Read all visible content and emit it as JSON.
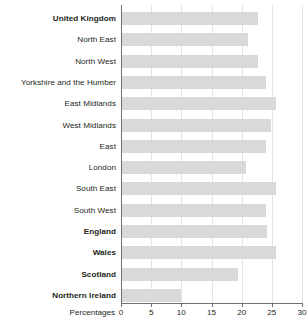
{
  "chart_data": {
    "type": "bar",
    "orientation": "horizontal",
    "title": "",
    "xlabel": "Percentages",
    "ylabel": "",
    "xlim": [
      0,
      30
    ],
    "xticks": [
      0,
      5,
      10,
      15,
      20,
      25,
      30
    ],
    "grid": true,
    "legend": false,
    "bar_color": "#d9d9d9",
    "categories": [
      "United Kingdom",
      "North East",
      "North West",
      "Yorkshire and the Humber",
      "East Midlands",
      "West Midlands",
      "East",
      "London",
      "South East",
      "South West",
      "England",
      "Wales",
      "Scotland",
      "Northern Ireland"
    ],
    "emphasis": [
      true,
      false,
      false,
      false,
      false,
      false,
      false,
      false,
      false,
      false,
      true,
      true,
      true,
      true
    ],
    "values": [
      22.7,
      21.0,
      22.7,
      24.0,
      25.7,
      24.8,
      24.0,
      20.8,
      25.7,
      24.0,
      24.2,
      25.7,
      19.4,
      10.0
    ]
  }
}
